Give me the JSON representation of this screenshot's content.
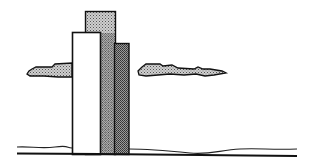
{
  "illustration": {
    "subject": "skyscrapers-with-clouds",
    "colors": {
      "background": "#ffffff",
      "ink": "#111111",
      "front_building_fill": "#ffffff",
      "screen_light": "#b8b8b8",
      "screen_dark": "#8a8a8a"
    },
    "buildings": [
      {
        "name": "back-tall",
        "x": 85,
        "y": 11,
        "w": 31,
        "h": 143,
        "fill": "dots-light"
      },
      {
        "name": "right-dark",
        "x": 114,
        "y": 43,
        "w": 15,
        "h": 111,
        "fill": "dots-dark"
      },
      {
        "name": "front-white",
        "x": 72,
        "y": 32,
        "w": 28,
        "h": 122,
        "fill": "white"
      }
    ],
    "clouds": [
      {
        "name": "left-cloud",
        "x1": 27,
        "x2": 73,
        "y": 63
      },
      {
        "name": "right-cloud",
        "x1": 138,
        "x2": 226,
        "y": 63
      }
    ],
    "ground_y": 154
  }
}
